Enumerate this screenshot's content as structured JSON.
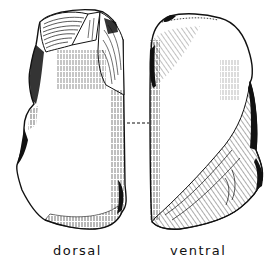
{
  "figure": {
    "views": [
      {
        "id": "dorsal",
        "label": "dorsal"
      },
      {
        "id": "ventral",
        "label": "ventral"
      }
    ],
    "connector": "dashed line linking views",
    "colors": {
      "ink": "#111111",
      "background": "#ffffff"
    }
  }
}
